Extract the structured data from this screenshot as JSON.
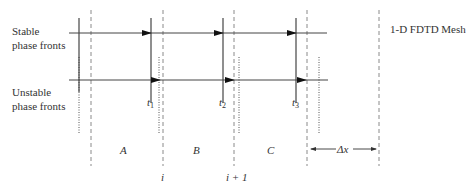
{
  "title": "1-D FDTD Mesh",
  "labels": {
    "stable_line1": "Stable",
    "stable_line2": "phase fronts",
    "unstable_line1": "Unstable",
    "unstable_line2": "phase fronts",
    "mesh_title": "1-D FDTD Mesh",
    "cell_a": "A",
    "cell_b": "B",
    "cell_c": "C",
    "node_i": "i",
    "node_i_plus_1": "i + 1",
    "delta_x": "Δx",
    "t": "t",
    "t1_sub": "1",
    "t2_sub": "2",
    "t3_sub": "3"
  },
  "geometry": {
    "mesh_lines_x": [
      91,
      163,
      234,
      307,
      379
    ],
    "stable_fronts_x": [
      79,
      151,
      223,
      296
    ],
    "unstable_fronts_x": [
      79,
      159,
      239,
      319
    ],
    "stable_arrow_y": 33,
    "unstable_arrow_y": 80
  },
  "colors": {
    "line": "#333333",
    "dashed": "#888888",
    "background": "#ffffff"
  }
}
